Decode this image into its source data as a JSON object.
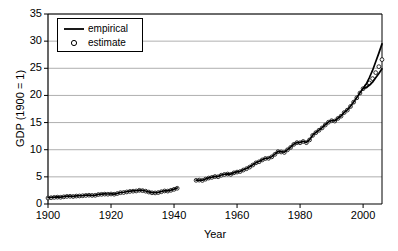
{
  "chart_data": {
    "type": "line",
    "title": "",
    "xlabel": "Year",
    "ylabel": "GDP (1900 = 1)",
    "xlim": [
      1900,
      2006
    ],
    "ylim": [
      0,
      35
    ],
    "xticks": [
      1900,
      1920,
      1940,
      1960,
      1980,
      2000
    ],
    "yticks": [
      0,
      5,
      10,
      15,
      20,
      25,
      30,
      35
    ],
    "grid": "horizontal",
    "legend_position": "upper-left-inside",
    "legend": [
      {
        "name": "empirical",
        "marker": "line",
        "color": "#000000"
      },
      {
        "name": "estimate",
        "marker": "circle",
        "color": "#000000"
      }
    ],
    "series": [
      {
        "name": "empirical",
        "marker": "line",
        "color": "#000000",
        "segments": [
          {
            "x": [
              1900,
              1901,
              1902,
              1903,
              1904,
              1905,
              1906,
              1907,
              1908,
              1909,
              1910,
              1911,
              1912,
              1913,
              1914,
              1915,
              1916,
              1917,
              1918,
              1919,
              1920,
              1921,
              1922,
              1923,
              1924,
              1925,
              1926,
              1927,
              1928,
              1929,
              1930,
              1931,
              1932,
              1933,
              1934,
              1935,
              1936,
              1937,
              1938,
              1939,
              1940,
              1941
            ],
            "y": [
              1.15,
              1.22,
              1.26,
              1.3,
              1.28,
              1.36,
              1.44,
              1.46,
              1.4,
              1.5,
              1.52,
              1.56,
              1.62,
              1.66,
              1.6,
              1.64,
              1.78,
              1.82,
              1.86,
              1.84,
              1.88,
              1.82,
              1.96,
              2.12,
              2.16,
              2.26,
              2.36,
              2.4,
              2.44,
              2.56,
              2.5,
              2.4,
              2.22,
              2.1,
              2.08,
              2.14,
              2.3,
              2.44,
              2.42,
              2.56,
              2.74,
              2.96
            ]
          },
          {
            "x": [
              1947,
              1948,
              1949,
              1950,
              1951,
              1952,
              1953,
              1954,
              1955,
              1956,
              1957,
              1958,
              1959,
              1960,
              1961,
              1962,
              1963,
              1964,
              1965,
              1966,
              1967,
              1968,
              1969,
              1970,
              1971,
              1972,
              1973,
              1974,
              1975,
              1976,
              1977,
              1978,
              1979,
              1980,
              1981,
              1982,
              1983,
              1984,
              1985,
              1986,
              1987,
              1988,
              1989,
              1990,
              1991,
              1992,
              1993,
              1994,
              1995,
              1996,
              1997,
              1998,
              1999,
              2000,
              2001,
              2002,
              2003,
              2004,
              2005,
              2006
            ],
            "y": [
              4.4,
              4.42,
              4.38,
              4.62,
              4.82,
              4.94,
              5.1,
              5.06,
              5.34,
              5.48,
              5.56,
              5.5,
              5.78,
              5.92,
              6.02,
              6.3,
              6.54,
              6.84,
              7.22,
              7.62,
              7.82,
              8.16,
              8.42,
              8.46,
              8.72,
              9.18,
              9.68,
              9.62,
              9.54,
              10.02,
              10.46,
              11.02,
              11.34,
              11.32,
              11.56,
              11.34,
              11.84,
              12.68,
              13.18,
              13.62,
              14.06,
              14.6,
              15.1,
              15.38,
              15.32,
              15.8,
              16.22,
              16.88,
              17.34,
              18.0,
              18.8,
              19.6,
              20.48,
              21.28,
              21.48,
              21.86,
              22.44,
              23.26,
              24.04,
              24.9
            ]
          },
          {
            "x": [
              2000,
              2001,
              2002,
              2003,
              2004,
              2005,
              2006
            ],
            "y": [
              21.28,
              22.1,
              23.3,
              24.6,
              26.2,
              27.8,
              29.5
            ]
          }
        ]
      },
      {
        "name": "estimate",
        "marker": "circle",
        "color": "#000000",
        "segments": [
          {
            "x": [
              1900,
              1901,
              1902,
              1903,
              1904,
              1905,
              1906,
              1907,
              1908,
              1909,
              1910,
              1911,
              1912,
              1913,
              1914,
              1915,
              1916,
              1917,
              1918,
              1919,
              1920,
              1921,
              1922,
              1923,
              1924,
              1925,
              1926,
              1927,
              1928,
              1929,
              1930,
              1931,
              1932,
              1933,
              1934,
              1935,
              1936,
              1937,
              1938,
              1939,
              1940,
              1941
            ],
            "y": [
              1.1,
              1.16,
              1.22,
              1.26,
              1.24,
              1.32,
              1.4,
              1.42,
              1.38,
              1.46,
              1.48,
              1.52,
              1.58,
              1.62,
              1.58,
              1.6,
              1.74,
              1.78,
              1.82,
              1.8,
              1.84,
              1.8,
              1.92,
              2.08,
              2.12,
              2.22,
              2.32,
              2.36,
              2.4,
              2.52,
              2.46,
              2.36,
              2.2,
              2.06,
              2.04,
              2.1,
              2.26,
              2.4,
              2.38,
              2.52,
              2.7,
              2.9
            ]
          },
          {
            "x": [
              1947,
              1948,
              1949,
              1950,
              1951,
              1952,
              1953,
              1954,
              1955,
              1956,
              1957,
              1958,
              1959,
              1960,
              1961,
              1962,
              1963,
              1964,
              1965,
              1966,
              1967,
              1968,
              1969,
              1970,
              1971,
              1972,
              1973,
              1974,
              1975,
              1976,
              1977,
              1978,
              1979,
              1980,
              1981,
              1982,
              1983,
              1984,
              1985,
              1986,
              1987,
              1988,
              1989,
              1990,
              1991,
              1992,
              1993,
              1994,
              1995,
              1996,
              1997,
              1998,
              1999,
              2000,
              2001,
              2002,
              2003,
              2004,
              2005,
              2006
            ],
            "y": [
              4.36,
              4.4,
              4.34,
              4.58,
              4.78,
              4.9,
              5.06,
              5.02,
              5.3,
              5.44,
              5.52,
              5.46,
              5.74,
              5.88,
              5.98,
              6.26,
              6.5,
              6.8,
              7.18,
              7.58,
              7.78,
              8.12,
              8.38,
              8.42,
              8.68,
              9.14,
              9.64,
              9.58,
              9.5,
              9.98,
              10.42,
              10.98,
              11.3,
              11.28,
              11.52,
              11.3,
              11.8,
              12.64,
              13.14,
              13.58,
              14.02,
              14.56,
              15.06,
              15.34,
              15.28,
              15.76,
              16.18,
              16.84,
              17.3,
              17.96,
              18.76,
              19.56,
              20.44,
              21.24,
              21.7,
              22.3,
              23.1,
              24.2,
              25.3,
              26.6
            ]
          }
        ]
      }
    ]
  }
}
